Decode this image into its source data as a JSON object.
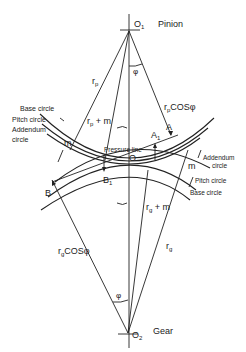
{
  "diagram": {
    "centers": {
      "pinion": {
        "point": "O1",
        "label": "Pinion"
      },
      "gear": {
        "point": "O2",
        "label": "Gear"
      }
    },
    "points": {
      "O": "O",
      "A": "A",
      "A1": "A1",
      "B": "B",
      "B1": "B1"
    },
    "labels": {
      "rp": "r",
      "rp_sub": "p",
      "rp_m": "r",
      "rp_m_sub": "p",
      "rp_m_tail": " + m",
      "rpcos": "r",
      "rpcos_sub": "p",
      "rpcos_tail": "COSφ",
      "rg": "r",
      "rg_sub": "g",
      "rg_m": "r",
      "rg_m_sub": "g",
      "rg_m_tail": " + m",
      "rgcos": "r",
      "rgcos_sub": "g",
      "rgcos_tail": "COSφ",
      "phi_top": "φ",
      "phi_bottom": "φ",
      "m_left": "m",
      "m_right": "m",
      "pressure_line": "Pressure line",
      "o1": "O",
      "o1_sub": "1",
      "o2": "O",
      "o2_sub": "2",
      "a1": "A",
      "a1_sub": "1",
      "b1": "B",
      "b1_sub": "1"
    },
    "left_callouts": {
      "base": "Base circle",
      "pitch": "Pitch circle",
      "addendum_1": "Addendum",
      "addendum_2": "circle"
    },
    "right_callouts": {
      "addendum_1": "Addendum",
      "addendum_2": "circle",
      "pitch": "Pitch circle",
      "base": "Base circle"
    }
  }
}
